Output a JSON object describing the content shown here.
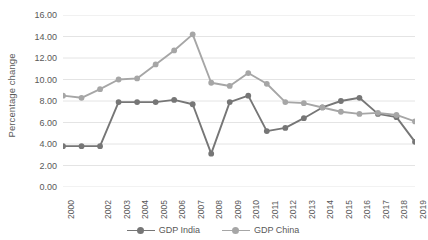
{
  "chart_data": {
    "type": "line",
    "title": "",
    "xlabel": "",
    "ylabel": "Percentage change",
    "ylim": [
      0,
      16
    ],
    "ytick_step": 2,
    "ytick_labels": [
      "16.00",
      "14.00",
      "12.00",
      "10.00",
      "8.00",
      "6.00",
      "4.00",
      "2.00",
      "0.00"
    ],
    "ytick_values": [
      16,
      14,
      12,
      10,
      8,
      6,
      4,
      2,
      0
    ],
    "grid": "horizontal",
    "legend_position": "bottom-center",
    "categories": [
      "2000",
      "2001",
      "2002",
      "2003",
      "2004",
      "2005",
      "2006",
      "2007",
      "2008",
      "2009",
      "2010",
      "2011",
      "2012",
      "2013",
      "2014",
      "2015",
      "2016",
      "2017",
      "2018",
      "2019"
    ],
    "xtick_labels": [
      "2000",
      "",
      "2002",
      "2003",
      "2004",
      "2005",
      "2006",
      "2007",
      "2008",
      "2009",
      "2010",
      "2011",
      "2012",
      "2013",
      "2014",
      "2015",
      "2016",
      "2017",
      "2018",
      "2019"
    ],
    "series": [
      {
        "name": "GDP India",
        "color": "#767676",
        "values": [
          3.8,
          3.8,
          3.8,
          7.9,
          7.9,
          7.9,
          8.1,
          7.7,
          3.1,
          7.9,
          8.5,
          5.2,
          5.5,
          6.4,
          7.4,
          8.0,
          8.3,
          6.8,
          6.5,
          4.2
        ]
      },
      {
        "name": "GDP China",
        "color": "#A6A6A6",
        "values": [
          8.5,
          8.3,
          9.1,
          10.0,
          10.1,
          11.4,
          12.7,
          14.2,
          9.7,
          9.4,
          10.6,
          9.6,
          7.9,
          7.8,
          7.4,
          7.0,
          6.8,
          6.9,
          6.7,
          6.1
        ]
      }
    ]
  },
  "legend": {
    "entries": [
      {
        "label": "GDP India",
        "color": "#767676"
      },
      {
        "label": "GDP China",
        "color": "#A6A6A6"
      }
    ]
  },
  "colors": {
    "india": "#767676",
    "china": "#A6A6A6",
    "gridline": "#E4E4E4",
    "text": "#595959",
    "background": "#FFFFFF"
  }
}
